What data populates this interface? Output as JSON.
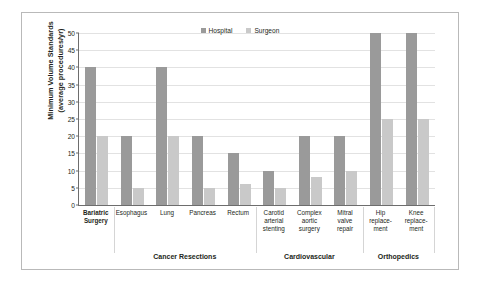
{
  "chart_data": {
    "type": "bar",
    "title": "",
    "xlabel": "",
    "ylabel": "Minimum Volume Standards (average procedures/yr)",
    "ylim": [
      0,
      50
    ],
    "yticks": [
      0,
      5,
      10,
      15,
      20,
      25,
      30,
      35,
      40,
      45,
      50
    ],
    "grid": true,
    "legend_position": "top-center",
    "categories": [
      "Bariatric Surgery",
      "Esophagus",
      "Lung",
      "Pancreas",
      "Rectum",
      "Carotid arterial stenting",
      "Complex aortic surgery",
      "Mitral valve repair",
      "Hip replace-ment",
      "Knee replace-ment"
    ],
    "series": [
      {
        "name": "Hospital",
        "color": "#9a9a9a",
        "values": [
          40,
          20,
          40,
          20,
          15,
          10,
          20,
          20,
          50,
          50
        ]
      },
      {
        "name": "Surgeon",
        "color": "#c9c9c9",
        "values": [
          20,
          5,
          20,
          5,
          6,
          5,
          8,
          10,
          25,
          25
        ]
      }
    ],
    "groups": [
      {
        "label": "Cancer Resections",
        "start": 1,
        "end": 4
      },
      {
        "label": "Cardiovascular",
        "start": 5,
        "end": 7
      },
      {
        "label": "Orthopedics",
        "start": 8,
        "end": 9
      }
    ]
  },
  "axis": {
    "y_title_line1": "Minimum Volume Standards",
    "y_title_line2": "(average procedures/yr)"
  },
  "category_labels": [
    {
      "lines": [
        "Bariatric",
        "Surgery"
      ],
      "bold": true
    },
    {
      "lines": [
        "Esophagus"
      ],
      "bold": false
    },
    {
      "lines": [
        "Lung"
      ],
      "bold": false
    },
    {
      "lines": [
        "Pancreas"
      ],
      "bold": false
    },
    {
      "lines": [
        "Rectum"
      ],
      "bold": false
    },
    {
      "lines": [
        "Carotid",
        "arterial",
        "stenting"
      ],
      "bold": false
    },
    {
      "lines": [
        "Complex",
        "aortic",
        "surgery"
      ],
      "bold": false
    },
    {
      "lines": [
        "Mitral",
        "valve",
        "repair"
      ],
      "bold": false
    },
    {
      "lines": [
        "Hip",
        "replace-",
        "ment"
      ],
      "bold": false
    },
    {
      "lines": [
        "Knee",
        "replace-",
        "ment"
      ],
      "bold": false
    }
  ]
}
